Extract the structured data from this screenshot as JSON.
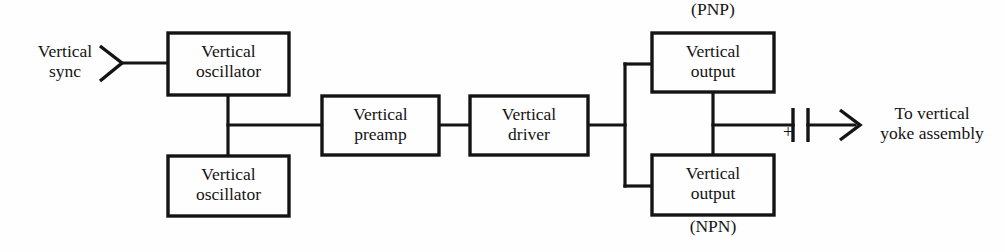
{
  "diagram": {
    "background_color": "#fefefe",
    "line_color": "#141414",
    "blocks": [
      {
        "id": "vertical-oscillator-1",
        "label": "Vertical\noscillator",
        "x": 168,
        "y": 33,
        "w": 121,
        "h": 62
      },
      {
        "id": "vertical-oscillator-2",
        "label": "Vertical\noscillator",
        "x": 168,
        "y": 156,
        "w": 121,
        "h": 60
      },
      {
        "id": "vertical-preamp",
        "label": "Vertical\npreamp",
        "x": 322,
        "y": 96,
        "w": 117,
        "h": 59
      },
      {
        "id": "vertical-driver",
        "label": "Vertical\ndriver",
        "x": 470,
        "y": 96,
        "w": 118,
        "h": 59
      },
      {
        "id": "vertical-output-pnp",
        "label": "Vertical\noutput",
        "x": 652,
        "y": 33,
        "w": 122,
        "h": 59
      },
      {
        "id": "vertical-output-npn",
        "label": "Vertical\noutput",
        "x": 652,
        "y": 155,
        "w": 122,
        "h": 60
      }
    ],
    "labels": {
      "input_sync": "Vertical\nsync",
      "pnp": "(PNP)",
      "npn": "(NPN)",
      "output_destination": "To vertical\nyoke assembly",
      "polarity": "+"
    },
    "symbols": {
      "input_arrowhead": "chevron-right-icon",
      "coupling_capacitor": "capacitor-icon",
      "output_arrow": "arrow-right-icon"
    }
  }
}
